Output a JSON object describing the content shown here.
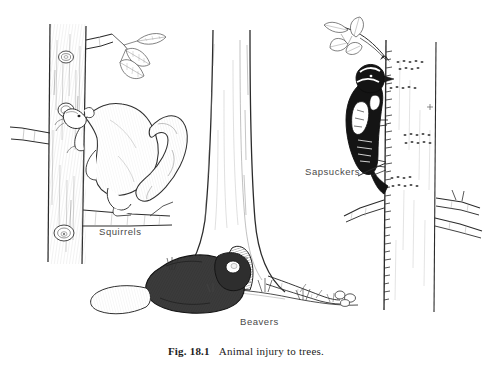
{
  "figure": {
    "caption_number": "Fig. 18.1",
    "caption_title": "Animal injury to trees.",
    "background_color": "#ffffff",
    "ink_color": "#1c1c1c",
    "label_color": "#4a4a4a",
    "medium": "pen-and-ink line drawing",
    "labels": [
      {
        "id": "squirrels",
        "text": "Squirrels"
      },
      {
        "id": "sapsuckers",
        "text": "Sapsuckers"
      },
      {
        "id": "beavers",
        "text": "Beavers"
      }
    ],
    "scene": {
      "description": "Three tree trunks showing damage by different animals",
      "elements": [
        {
          "name": "squirrel-on-trunk",
          "detail": "Squirrel climbing a trunk gnawing bark, bushy tail curled upward, leafy twig above, branch stubs and knots on trunk"
        },
        {
          "name": "beaver-at-trunk-base",
          "detail": "Beaver gnawing a wedge-shaped notch at the flared base of the center trunk, felled stick and wood chips on ground"
        },
        {
          "name": "sapsucker-on-trunk",
          "detail": "Black and white sapsucker clinging to a trunk above horizontal bands of drilled sap holes"
        }
      ]
    }
  }
}
